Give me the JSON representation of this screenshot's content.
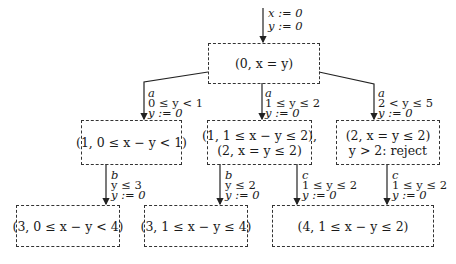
{
  "diagram": {
    "type": "tree / zone graph",
    "initial_edge": {
      "resets": [
        "x := 0",
        "y := 0"
      ]
    },
    "nodes": [
      {
        "id": "root",
        "lines": [
          "(0, x = y)"
        ]
      },
      {
        "id": "n1",
        "lines": [
          "(1, 0 ≤ x − y < 1)"
        ]
      },
      {
        "id": "n2",
        "lines": [
          "(1, 1 ≤ x − y ≤ 2),",
          "(2, x = y ≤ 2)"
        ]
      },
      {
        "id": "n3",
        "lines": [
          "(2, x = y ≤ 2)",
          "y > 2: reject"
        ]
      },
      {
        "id": "n4",
        "lines": [
          "(3, 0 ≤ x − y < 4)"
        ]
      },
      {
        "id": "n5",
        "lines": [
          "(3, 1 ≤ x − y ≤ 4)"
        ]
      },
      {
        "id": "n6",
        "lines": [
          "(4, 1 ≤ x − y ≤ 2)"
        ]
      }
    ],
    "edges": [
      {
        "from": "root",
        "to": "n1",
        "action": "a",
        "guard": "0 ≤ y < 1",
        "reset": "y := 0"
      },
      {
        "from": "root",
        "to": "n2",
        "action": "a",
        "guard": "1 ≤ y ≤ 2",
        "reset": "y := 0"
      },
      {
        "from": "root",
        "to": "n3",
        "action": "a",
        "guard": "2 < y ≤ 5",
        "reset": "y := 0"
      },
      {
        "from": "n1",
        "to": "n4",
        "action": "b",
        "guard": "y ≤ 3",
        "reset": "y := 0"
      },
      {
        "from": "n2",
        "to": "n5",
        "action": "b",
        "guard": "y ≤ 2",
        "reset": "y := 0"
      },
      {
        "from": "n2",
        "to": "n6",
        "action": "c",
        "guard": "1 ≤ y ≤ 2",
        "reset": "y := 0"
      },
      {
        "from": "n3",
        "to": "n6",
        "action": "c",
        "guard": "1 ≤ y ≤ 2",
        "reset": "y := 0"
      }
    ]
  }
}
